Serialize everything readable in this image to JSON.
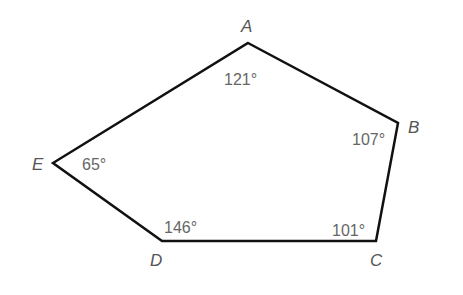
{
  "diagram": {
    "type": "pentagon",
    "stroke_color": "#111111",
    "label_color": "#555555",
    "vertices": [
      {
        "name": "A",
        "x": 248,
        "y": 43,
        "angle": "121°"
      },
      {
        "name": "B",
        "x": 398,
        "y": 123,
        "angle": "107°"
      },
      {
        "name": "C",
        "x": 376,
        "y": 241,
        "angle": "101°"
      },
      {
        "name": "D",
        "x": 162,
        "y": 241,
        "angle": "146°"
      },
      {
        "name": "E",
        "x": 53,
        "y": 163,
        "angle": "65°"
      }
    ]
  }
}
